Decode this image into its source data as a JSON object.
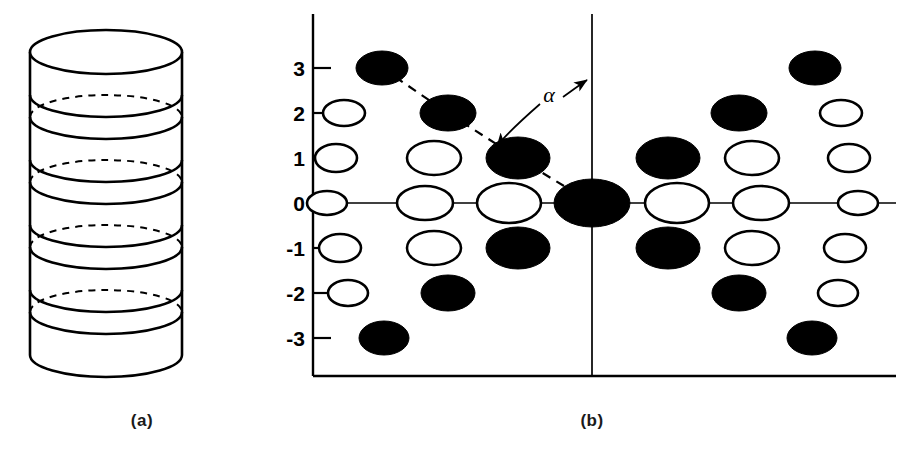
{
  "figure": {
    "caption_a": "(a)",
    "caption_b": "(b)",
    "angle_label": "α",
    "colors": {
      "line": "#000000",
      "fill_marker": "#000000",
      "open_marker": "#ffffff",
      "background": "#ffffff",
      "caption": "#1a1a1a"
    }
  },
  "panel_a": {
    "name": "stacked-disk-cylinder",
    "description": "cylinder composed of stacked elliptical disks",
    "disk_count": 5,
    "cylinder": {
      "left": 30,
      "right": 182,
      "top": 30,
      "bottom": 356,
      "ellipse_rx": 76,
      "ellipse_ry": 22,
      "disk_gap": 65
    },
    "disk_top_y": [
      52,
      117,
      182,
      247,
      312
    ],
    "disk_bottom_y": [
      95,
      160,
      225,
      290,
      355
    ]
  },
  "panel_b": {
    "name": "diffraction-pattern-plot",
    "axis": {
      "frame_left": 313,
      "frame_bottom": 376,
      "frame_right": 896,
      "vertical_axis_x": 592,
      "vertical_axis_top": 14,
      "horizontal_axis_y": 203,
      "horizontal_axis_left": 313,
      "horizontal_axis_right": 896
    },
    "y_ticks": [
      {
        "label": "3",
        "value": 3,
        "y": 68
      },
      {
        "label": "2",
        "value": 2,
        "y": 113
      },
      {
        "label": "1",
        "value": 1,
        "y": 158
      },
      {
        "label": "0",
        "value": 0,
        "y": 203
      },
      {
        "label": "-1",
        "value": -1,
        "y": 248
      },
      {
        "label": "-2",
        "value": -2,
        "y": 293
      },
      {
        "label": "-3",
        "value": -3,
        "y": 338
      }
    ],
    "columns_x": [
      348,
      425,
      505,
      592,
      675,
      760,
      840
    ],
    "markers": [
      {
        "col": 0,
        "row": 3,
        "cx": 382,
        "cy": 68,
        "rx": 26,
        "ry": 17,
        "filled": true
      },
      {
        "col": 0,
        "row": 2,
        "cx": 344,
        "cy": 113,
        "rx": 21,
        "ry": 13,
        "filled": false
      },
      {
        "col": 0,
        "row": 1,
        "cx": 336,
        "cy": 158,
        "rx": 21,
        "ry": 14,
        "filled": false
      },
      {
        "col": 0,
        "row": 0,
        "cx": 327,
        "cy": 203,
        "rx": 20,
        "ry": 12,
        "filled": false
      },
      {
        "col": 0,
        "row": -1,
        "cx": 340,
        "cy": 248,
        "rx": 21,
        "ry": 14,
        "filled": false
      },
      {
        "col": 0,
        "row": -2,
        "cx": 348,
        "cy": 293,
        "rx": 20,
        "ry": 13,
        "filled": false
      },
      {
        "col": 0,
        "row": -3,
        "cx": 384,
        "cy": 338,
        "rx": 25,
        "ry": 17,
        "filled": true
      },
      {
        "col": 1,
        "row": 2,
        "cx": 448,
        "cy": 113,
        "rx": 28,
        "ry": 18,
        "filled": true
      },
      {
        "col": 1,
        "row": 1,
        "cx": 434,
        "cy": 158,
        "rx": 27,
        "ry": 17,
        "filled": false
      },
      {
        "col": 1,
        "row": 0,
        "cx": 425,
        "cy": 203,
        "rx": 28,
        "ry": 17,
        "filled": false
      },
      {
        "col": 1,
        "row": -1,
        "cx": 434,
        "cy": 248,
        "rx": 27,
        "ry": 17,
        "filled": false
      },
      {
        "col": 1,
        "row": -2,
        "cx": 448,
        "cy": 293,
        "rx": 27,
        "ry": 18,
        "filled": true
      },
      {
        "col": 2,
        "row": 1,
        "cx": 518,
        "cy": 158,
        "rx": 32,
        "ry": 21,
        "filled": true
      },
      {
        "col": 2,
        "row": 0,
        "cx": 509,
        "cy": 203,
        "rx": 32,
        "ry": 20,
        "filled": false
      },
      {
        "col": 2,
        "row": -1,
        "cx": 518,
        "cy": 248,
        "rx": 32,
        "ry": 21,
        "filled": true
      },
      {
        "col": 3,
        "row": 0,
        "cx": 592,
        "cy": 203,
        "rx": 38,
        "ry": 24,
        "filled": true
      },
      {
        "col": 4,
        "row": 1,
        "cx": 668,
        "cy": 158,
        "rx": 32,
        "ry": 21,
        "filled": true
      },
      {
        "col": 4,
        "row": 0,
        "cx": 677,
        "cy": 203,
        "rx": 32,
        "ry": 20,
        "filled": false
      },
      {
        "col": 4,
        "row": -1,
        "cx": 668,
        "cy": 248,
        "rx": 32,
        "ry": 21,
        "filled": true
      },
      {
        "col": 5,
        "row": 2,
        "cx": 739,
        "cy": 113,
        "rx": 28,
        "ry": 18,
        "filled": true
      },
      {
        "col": 5,
        "row": 1,
        "cx": 752,
        "cy": 158,
        "rx": 27,
        "ry": 17,
        "filled": false
      },
      {
        "col": 5,
        "row": 0,
        "cx": 761,
        "cy": 203,
        "rx": 28,
        "ry": 17,
        "filled": false
      },
      {
        "col": 5,
        "row": -1,
        "cx": 752,
        "cy": 248,
        "rx": 27,
        "ry": 17,
        "filled": false
      },
      {
        "col": 5,
        "row": -2,
        "cx": 739,
        "cy": 293,
        "rx": 27,
        "ry": 18,
        "filled": true
      },
      {
        "col": 6,
        "row": 3,
        "cx": 815,
        "cy": 68,
        "rx": 26,
        "ry": 17,
        "filled": true
      },
      {
        "col": 6,
        "row": 2,
        "cx": 841,
        "cy": 113,
        "rx": 21,
        "ry": 13,
        "filled": false
      },
      {
        "col": 6,
        "row": 1,
        "cx": 849,
        "cy": 158,
        "rx": 21,
        "ry": 14,
        "filled": false
      },
      {
        "col": 6,
        "row": 0,
        "cx": 858,
        "cy": 203,
        "rx": 20,
        "ry": 12,
        "filled": false
      },
      {
        "col": 6,
        "row": -1,
        "cx": 845,
        "cy": 248,
        "rx": 21,
        "ry": 14,
        "filled": false
      },
      {
        "col": 6,
        "row": -2,
        "cx": 838,
        "cy": 293,
        "rx": 20,
        "ry": 13,
        "filled": false
      },
      {
        "col": 6,
        "row": -3,
        "cx": 812,
        "cy": 338,
        "rx": 25,
        "ry": 17,
        "filled": true
      }
    ],
    "dashed_line": {
      "points": "382,68 448,113 518,158 592,203",
      "description": "layer line connecting filled reflections through origin"
    },
    "angle_annotation": {
      "label": "α",
      "label_x": 549,
      "label_y": 97,
      "arc_path": "M 494,150 C 510,120 545,96 588,80",
      "from": "dashed-layer-line",
      "to": "vertical-meridian-axis"
    }
  }
}
